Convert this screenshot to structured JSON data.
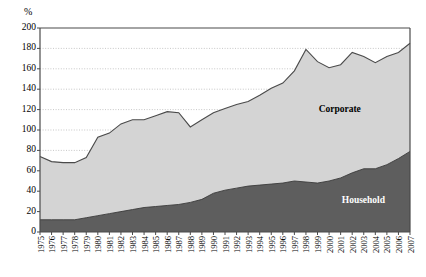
{
  "chart_data": {
    "type": "area",
    "stacked": true,
    "title": "",
    "subtitle": "",
    "xlabel": "",
    "ylabel": "",
    "unit_symbol": "%",
    "ylim": [
      0,
      200
    ],
    "ytick_step": 20,
    "yticks": [
      0,
      20,
      40,
      60,
      80,
      100,
      120,
      140,
      160,
      180,
      200
    ],
    "grid": "horizontal-dotted",
    "legend_position": "inline-annotations",
    "categories": [
      "1975",
      "1976",
      "1977",
      "1978",
      "1979",
      "1980",
      "1981",
      "1982",
      "1983",
      "1984",
      "1985",
      "1986",
      "1987",
      "1988",
      "1989",
      "1990",
      "1991",
      "1992",
      "1993",
      "1994",
      "1995",
      "1996",
      "1997",
      "1998",
      "1999",
      "2000",
      "2001",
      "2002",
      "2003",
      "2004",
      "2005",
      "2006",
      "2007"
    ],
    "series": [
      {
        "name": "Household",
        "color": "#5e5e5e",
        "values": [
          12,
          12,
          12,
          12,
          14,
          16,
          18,
          20,
          22,
          24,
          25,
          26,
          27,
          29,
          32,
          38,
          41,
          43,
          45,
          46,
          47,
          48,
          50,
          49,
          48,
          50,
          53,
          58,
          62,
          62,
          66,
          72,
          79
        ]
      },
      {
        "name": "Corporate",
        "color": "#d4d4d4",
        "values": [
          62,
          57,
          56,
          56,
          59,
          77,
          79,
          86,
          88,
          86,
          89,
          92,
          90,
          74,
          78,
          79,
          80,
          82,
          83,
          88,
          94,
          98,
          108,
          130,
          119,
          111,
          111,
          118,
          110,
          104,
          106,
          104,
          106
        ]
      }
    ],
    "totals": [
      74,
      69,
      68,
      68,
      73,
      93,
      97,
      106,
      110,
      110,
      114,
      118,
      117,
      103,
      110,
      117,
      121,
      125,
      128,
      134,
      141,
      146,
      158,
      179,
      167,
      161,
      164,
      176,
      172,
      166,
      172,
      176,
      185
    ],
    "annotations": [
      {
        "text": "Corporate",
        "series": "Corporate",
        "x_year": "2001",
        "y_value": 120
      },
      {
        "text": "Household",
        "series": "Household",
        "x_year": "2003",
        "y_value": 30
      }
    ]
  },
  "axis_colors": {
    "axis_line": "#4a4a4a",
    "grid_line": "#b9b9b9",
    "stroke_line": "#4a4a4a"
  }
}
